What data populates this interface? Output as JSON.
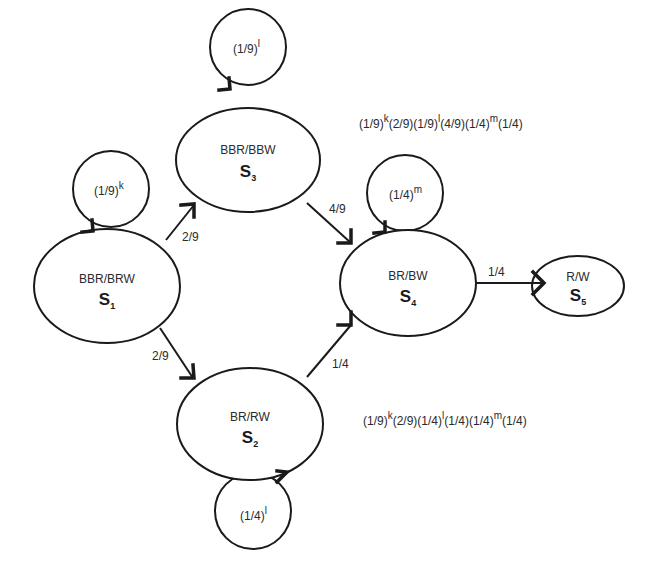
{
  "diagram": {
    "type": "state-transition",
    "states": [
      {
        "id": "S1",
        "name": "BBR/BRW",
        "label": "S",
        "subscript": "1",
        "loop": {
          "base": "(1/9)",
          "exp": "k"
        }
      },
      {
        "id": "S2",
        "name": "BR/RW",
        "label": "S",
        "subscript": "2",
        "loop": {
          "base": "(1/4)",
          "exp": "l"
        }
      },
      {
        "id": "S3",
        "name": "BBR/BBW",
        "label": "S",
        "subscript": "3",
        "loop": {
          "base": "(1/9)",
          "exp": "l"
        }
      },
      {
        "id": "S4",
        "name": "BR/BW",
        "label": "S",
        "subscript": "4",
        "loop": {
          "base": "(1/4)",
          "exp": "m"
        }
      },
      {
        "id": "S5",
        "name": "R/W",
        "label": "S",
        "subscript": "5"
      }
    ],
    "transitions": [
      {
        "from": "S1",
        "to": "S3",
        "prob": "2/9"
      },
      {
        "from": "S1",
        "to": "S2",
        "prob": "2/9"
      },
      {
        "from": "S3",
        "to": "S4",
        "prob": "4/9"
      },
      {
        "from": "S2",
        "to": "S4",
        "prob": "1/4"
      },
      {
        "from": "S4",
        "to": "S5",
        "prob": "1/4"
      }
    ],
    "path_formulas": {
      "upper": [
        {
          "t": "(1/9)"
        },
        {
          "sup": "k"
        },
        {
          "t": "(2/9)(1/9)"
        },
        {
          "sup": "l"
        },
        {
          "t": "(4/9)(1/4)"
        },
        {
          "sup": "m"
        },
        {
          "t": "(1/4)"
        }
      ],
      "lower": [
        {
          "t": "(1/9)"
        },
        {
          "sup": "k"
        },
        {
          "t": "(2/9)(1/4)"
        },
        {
          "sup": "l"
        },
        {
          "t": "(1/4)(1/4)"
        },
        {
          "sup": "m"
        },
        {
          "t": "(1/4)"
        }
      ]
    }
  }
}
